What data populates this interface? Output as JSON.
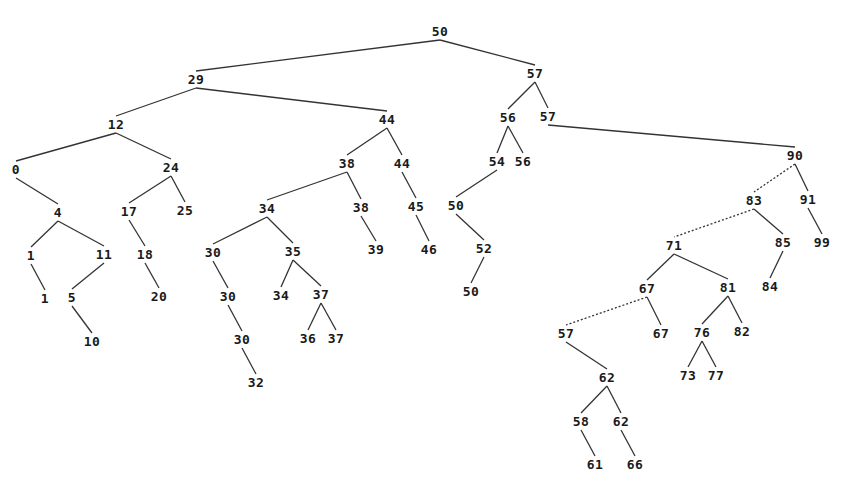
{
  "diagram": {
    "type": "binary-search-tree",
    "line_color": "#333333",
    "text_color": "#1a1a1a",
    "nodes": [
      {
        "id": "n50",
        "label": "50",
        "x": 440,
        "y": 31
      },
      {
        "id": "n29",
        "label": "29",
        "x": 196,
        "y": 79
      },
      {
        "id": "n57a",
        "label": "57",
        "x": 535,
        "y": 73
      },
      {
        "id": "n12",
        "label": "12",
        "x": 116,
        "y": 124
      },
      {
        "id": "n44a",
        "label": "44",
        "x": 387,
        "y": 119
      },
      {
        "id": "n56a",
        "label": "56",
        "x": 508,
        "y": 117
      },
      {
        "id": "n57b",
        "label": "57",
        "x": 548,
        "y": 116
      },
      {
        "id": "n0",
        "label": "0",
        "x": 16,
        "y": 169
      },
      {
        "id": "n24",
        "label": "24",
        "x": 171,
        "y": 167
      },
      {
        "id": "n38a",
        "label": "38",
        "x": 347,
        "y": 163
      },
      {
        "id": "n44b",
        "label": "44",
        "x": 402,
        "y": 163
      },
      {
        "id": "n54",
        "label": "54",
        "x": 497,
        "y": 161
      },
      {
        "id": "n56b",
        "label": "56",
        "x": 523,
        "y": 161
      },
      {
        "id": "n90",
        "label": "90",
        "x": 795,
        "y": 155
      },
      {
        "id": "n4",
        "label": "4",
        "x": 58,
        "y": 212
      },
      {
        "id": "n17",
        "label": "17",
        "x": 129,
        "y": 211
      },
      {
        "id": "n25",
        "label": "25",
        "x": 185,
        "y": 210
      },
      {
        "id": "n34a",
        "label": "34",
        "x": 267,
        "y": 208
      },
      {
        "id": "n38b",
        "label": "38",
        "x": 361,
        "y": 207
      },
      {
        "id": "n45",
        "label": "45",
        "x": 416,
        "y": 206
      },
      {
        "id": "n50b",
        "label": "50",
        "x": 456,
        "y": 205
      },
      {
        "id": "n83",
        "label": "83",
        "x": 754,
        "y": 200
      },
      {
        "id": "n91",
        "label": "91",
        "x": 808,
        "y": 199
      },
      {
        "id": "n1a",
        "label": "1",
        "x": 31,
        "y": 255
      },
      {
        "id": "n11",
        "label": "11",
        "x": 104,
        "y": 254
      },
      {
        "id": "n18",
        "label": "18",
        "x": 145,
        "y": 254
      },
      {
        "id": "n30a",
        "label": "30",
        "x": 213,
        "y": 252
      },
      {
        "id": "n35",
        "label": "35",
        "x": 293,
        "y": 251
      },
      {
        "id": "n39",
        "label": "39",
        "x": 376,
        "y": 249
      },
      {
        "id": "n46",
        "label": "46",
        "x": 429,
        "y": 249
      },
      {
        "id": "n52",
        "label": "52",
        "x": 484,
        "y": 248
      },
      {
        "id": "n71",
        "label": "71",
        "x": 674,
        "y": 245
      },
      {
        "id": "n85",
        "label": "85",
        "x": 783,
        "y": 242
      },
      {
        "id": "n99",
        "label": "99",
        "x": 822,
        "y": 242
      },
      {
        "id": "n1b",
        "label": "1",
        "x": 45,
        "y": 298
      },
      {
        "id": "n5",
        "label": "5",
        "x": 72,
        "y": 297
      },
      {
        "id": "n20",
        "label": "20",
        "x": 159,
        "y": 296
      },
      {
        "id": "n30b",
        "label": "30",
        "x": 228,
        "y": 296
      },
      {
        "id": "n34b",
        "label": "34",
        "x": 281,
        "y": 295
      },
      {
        "id": "n37a",
        "label": "37",
        "x": 321,
        "y": 294
      },
      {
        "id": "n50c",
        "label": "50",
        "x": 471,
        "y": 291
      },
      {
        "id": "n67a",
        "label": "67",
        "x": 647,
        "y": 288
      },
      {
        "id": "n81",
        "label": "81",
        "x": 728,
        "y": 287
      },
      {
        "id": "n84",
        "label": "84",
        "x": 770,
        "y": 286
      },
      {
        "id": "n10",
        "label": "10",
        "x": 92,
        "y": 341
      },
      {
        "id": "n30c",
        "label": "30",
        "x": 242,
        "y": 339
      },
      {
        "id": "n36",
        "label": "36",
        "x": 308,
        "y": 338
      },
      {
        "id": "n37b",
        "label": "37",
        "x": 336,
        "y": 338
      },
      {
        "id": "n57c",
        "label": "57",
        "x": 566,
        "y": 333
      },
      {
        "id": "n67b",
        "label": "67",
        "x": 661,
        "y": 333
      },
      {
        "id": "n76",
        "label": "76",
        "x": 702,
        "y": 332
      },
      {
        "id": "n82",
        "label": "82",
        "x": 742,
        "y": 331
      },
      {
        "id": "n32",
        "label": "32",
        "x": 256,
        "y": 382
      },
      {
        "id": "n62a",
        "label": "62",
        "x": 607,
        "y": 377
      },
      {
        "id": "n73",
        "label": "73",
        "x": 688,
        "y": 375
      },
      {
        "id": "n77",
        "label": "77",
        "x": 716,
        "y": 375
      },
      {
        "id": "n58",
        "label": "58",
        "x": 581,
        "y": 421
      },
      {
        "id": "n62b",
        "label": "62",
        "x": 621,
        "y": 421
      },
      {
        "id": "n61",
        "label": "61",
        "x": 595,
        "y": 464
      },
      {
        "id": "n66",
        "label": "66",
        "x": 635,
        "y": 464
      }
    ],
    "edges": [
      {
        "from": "n50",
        "to": "n29",
        "style": "solid"
      },
      {
        "from": "n50",
        "to": "n57a",
        "style": "solid"
      },
      {
        "from": "n29",
        "to": "n12",
        "style": "solid"
      },
      {
        "from": "n29",
        "to": "n44a",
        "style": "solid"
      },
      {
        "from": "n57a",
        "to": "n56a",
        "style": "solid"
      },
      {
        "from": "n57a",
        "to": "n57b",
        "style": "solid"
      },
      {
        "from": "n12",
        "to": "n0",
        "style": "solid"
      },
      {
        "from": "n12",
        "to": "n24",
        "style": "solid"
      },
      {
        "from": "n44a",
        "to": "n38a",
        "style": "solid"
      },
      {
        "from": "n44a",
        "to": "n44b",
        "style": "solid"
      },
      {
        "from": "n56a",
        "to": "n54",
        "style": "solid"
      },
      {
        "from": "n56a",
        "to": "n56b",
        "style": "solid"
      },
      {
        "from": "n57b",
        "to": "n90",
        "style": "solid"
      },
      {
        "from": "n0",
        "to": "n4",
        "style": "solid"
      },
      {
        "from": "n24",
        "to": "n17",
        "style": "solid"
      },
      {
        "from": "n24",
        "to": "n25",
        "style": "solid"
      },
      {
        "from": "n38a",
        "to": "n34a",
        "style": "solid"
      },
      {
        "from": "n38a",
        "to": "n38b",
        "style": "solid"
      },
      {
        "from": "n44b",
        "to": "n45",
        "style": "solid"
      },
      {
        "from": "n54",
        "to": "n50b",
        "style": "solid"
      },
      {
        "from": "n90",
        "to": "n83",
        "style": "dotted"
      },
      {
        "from": "n90",
        "to": "n91",
        "style": "solid"
      },
      {
        "from": "n4",
        "to": "n1a",
        "style": "solid"
      },
      {
        "from": "n4",
        "to": "n11",
        "style": "solid"
      },
      {
        "from": "n17",
        "to": "n18",
        "style": "solid"
      },
      {
        "from": "n34a",
        "to": "n30a",
        "style": "solid"
      },
      {
        "from": "n34a",
        "to": "n35",
        "style": "solid"
      },
      {
        "from": "n38b",
        "to": "n39",
        "style": "solid"
      },
      {
        "from": "n45",
        "to": "n46",
        "style": "solid"
      },
      {
        "from": "n50b",
        "to": "n52",
        "style": "solid"
      },
      {
        "from": "n83",
        "to": "n71",
        "style": "dotted"
      },
      {
        "from": "n83",
        "to": "n85",
        "style": "solid"
      },
      {
        "from": "n91",
        "to": "n99",
        "style": "solid"
      },
      {
        "from": "n1a",
        "to": "n1b",
        "style": "solid"
      },
      {
        "from": "n11",
        "to": "n5",
        "style": "solid"
      },
      {
        "from": "n18",
        "to": "n20",
        "style": "solid"
      },
      {
        "from": "n30a",
        "to": "n30b",
        "style": "solid"
      },
      {
        "from": "n35",
        "to": "n34b",
        "style": "solid"
      },
      {
        "from": "n35",
        "to": "n37a",
        "style": "solid"
      },
      {
        "from": "n52",
        "to": "n50c",
        "style": "solid"
      },
      {
        "from": "n71",
        "to": "n67a",
        "style": "solid"
      },
      {
        "from": "n71",
        "to": "n81",
        "style": "solid"
      },
      {
        "from": "n85",
        "to": "n84",
        "style": "solid"
      },
      {
        "from": "n5",
        "to": "n10",
        "style": "solid"
      },
      {
        "from": "n30b",
        "to": "n30c",
        "style": "solid"
      },
      {
        "from": "n37a",
        "to": "n36",
        "style": "solid"
      },
      {
        "from": "n37a",
        "to": "n37b",
        "style": "solid"
      },
      {
        "from": "n67a",
        "to": "n57c",
        "style": "dotted"
      },
      {
        "from": "n67a",
        "to": "n67b",
        "style": "solid"
      },
      {
        "from": "n81",
        "to": "n76",
        "style": "solid"
      },
      {
        "from": "n81",
        "to": "n82",
        "style": "solid"
      },
      {
        "from": "n30c",
        "to": "n32",
        "style": "solid"
      },
      {
        "from": "n57c",
        "to": "n62a",
        "style": "solid"
      },
      {
        "from": "n76",
        "to": "n73",
        "style": "solid"
      },
      {
        "from": "n76",
        "to": "n77",
        "style": "solid"
      },
      {
        "from": "n62a",
        "to": "n58",
        "style": "solid"
      },
      {
        "from": "n62a",
        "to": "n62b",
        "style": "solid"
      },
      {
        "from": "n58",
        "to": "n61",
        "style": "solid"
      },
      {
        "from": "n62b",
        "to": "n66",
        "style": "solid"
      }
    ]
  }
}
